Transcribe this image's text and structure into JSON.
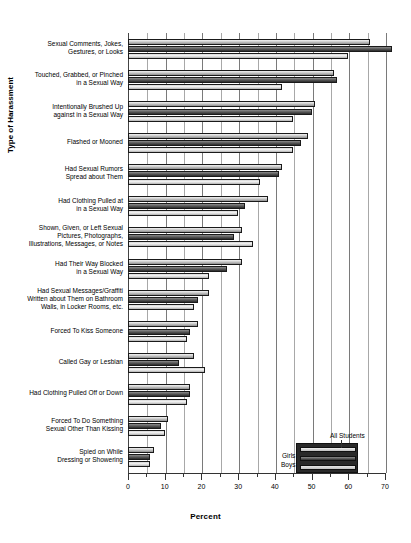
{
  "chart_data": {
    "type": "bar",
    "orientation": "horizontal",
    "title": "",
    "xlabel": "Percent",
    "ylabel": "Type of Harassment",
    "xlim": [
      0,
      70
    ],
    "xticks": [
      0,
      10,
      20,
      30,
      40,
      50,
      60,
      70
    ],
    "xtick_labels": [
      "0",
      "10",
      "20",
      "30",
      "40",
      "50",
      "60",
      "70"
    ],
    "minor_xticks": [
      5,
      15,
      25,
      35,
      45,
      55,
      65
    ],
    "grid": "vertical",
    "legend_position": "bottom-right",
    "categories": [
      "Sexual Comments, Jokes,\nGestures, or Looks",
      "Touched, Grabbed, or Pinched\nin a Sexual Way",
      "Intentionally Brushed Up\nagainst in a Sexual Way",
      "Flashed or Mooned",
      "Had Sexual Rumors\nSpread about Them",
      "Had Clothing Pulled at\nin a Sexual Way",
      "Shown, Given, or Left Sexual\nPictures, Photographs,\nIllustrations, Messages, or Notes",
      "Had Their Way Blocked\nin a Sexual Way",
      "Had Sexual Messages/Graffiti\nWritten about Them on Bathroom\nWalls, in Locker Rooms, etc.",
      "Forced To Kiss Someone",
      "Called Gay or Lesbian",
      "Had Clothing Pulled Off or Down",
      "Forced To Do Something\nSexual Other Than Kissing",
      "Spied on While\nDressing or Showering"
    ],
    "series": [
      {
        "name": "All Students",
        "color": "#cfcfcf",
        "values": [
          66,
          56,
          51,
          49,
          42,
          38,
          31,
          31,
          22,
          19,
          18,
          17,
          11,
          7
        ]
      },
      {
        "name": "Girls",
        "color": "#3a3a3a",
        "values": [
          72,
          57,
          50,
          47,
          41,
          32,
          29,
          27,
          19,
          17,
          14,
          17,
          9,
          6
        ]
      },
      {
        "name": "Boys",
        "color": "#e8e8e8",
        "values": [
          60,
          42,
          45,
          45,
          36,
          30,
          34,
          22,
          18,
          16,
          21,
          16,
          10,
          6
        ]
      }
    ],
    "legend_entries": [
      "All Students",
      "Girls",
      "Boys"
    ]
  }
}
